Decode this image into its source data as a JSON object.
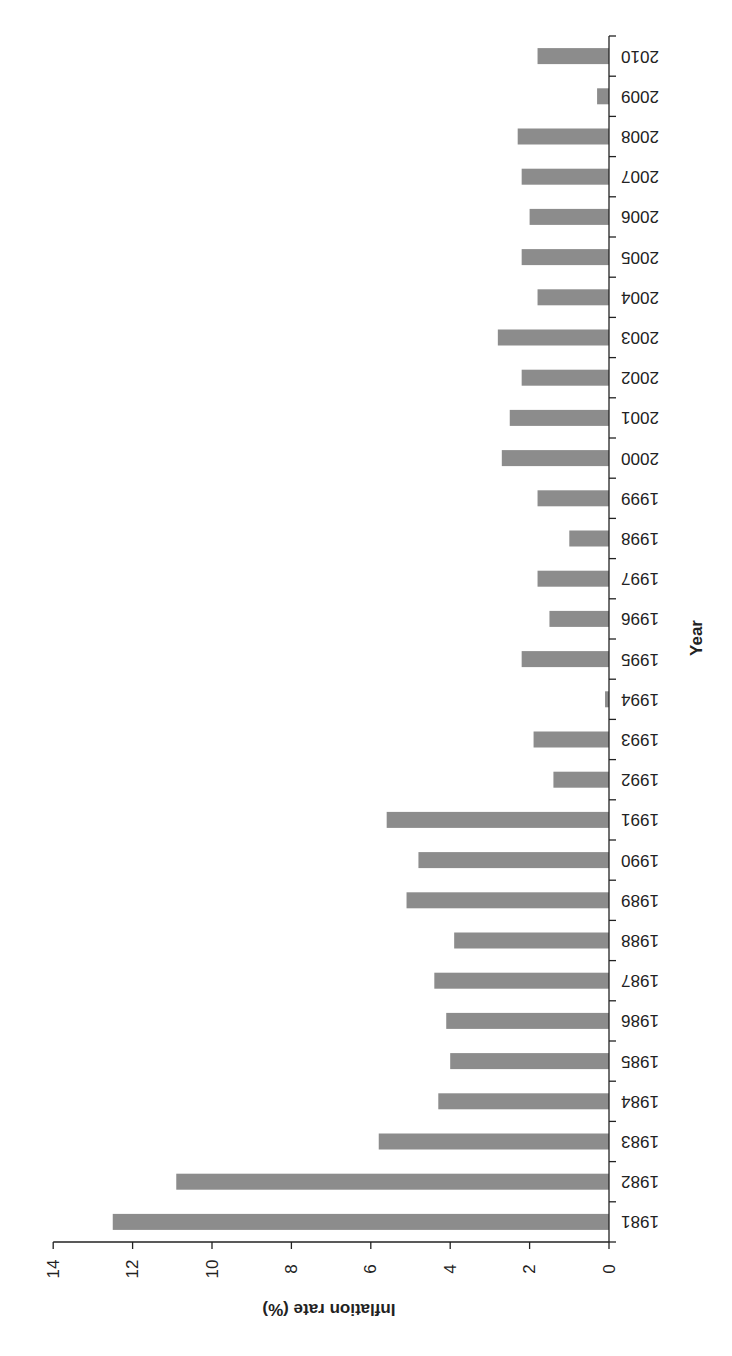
{
  "chart_data": {
    "type": "bar",
    "orientation": "horizontal",
    "rotation_deg": 180,
    "title": "",
    "xlabel": "Year",
    "ylabel": "Inflation rate (%)",
    "ylim": [
      0,
      14
    ],
    "yticks": [
      0,
      2,
      4,
      6,
      8,
      10,
      12,
      14
    ],
    "grid": false,
    "legend": null,
    "categories": [
      "1981",
      "1982",
      "1983",
      "1984",
      "1985",
      "1986",
      "1987",
      "1988",
      "1989",
      "1990",
      "1991",
      "1992",
      "1993",
      "1994",
      "1995",
      "1996",
      "1997",
      "1998",
      "1999",
      "2000",
      "2001",
      "2002",
      "2003",
      "2004",
      "2005",
      "2006",
      "2007",
      "2008",
      "2009",
      "2010"
    ],
    "series": [
      {
        "name": "Inflation rate (%)",
        "color": "#8c8c8c",
        "values": [
          12.5,
          10.9,
          5.8,
          4.3,
          4.0,
          4.1,
          4.4,
          3.9,
          5.1,
          4.8,
          5.6,
          1.4,
          1.9,
          0.1,
          2.2,
          1.5,
          1.8,
          1.0,
          1.8,
          2.7,
          2.5,
          2.2,
          2.8,
          1.8,
          2.2,
          2.0,
          2.2,
          2.3,
          0.3,
          1.8
        ]
      }
    ]
  },
  "labels": {
    "value_axis_title": "Inflation rate (%)",
    "category_axis_title": "Year"
  },
  "colors": {
    "bar": "#8c8c8c",
    "axis": "#222222",
    "background": "#ffffff"
  }
}
